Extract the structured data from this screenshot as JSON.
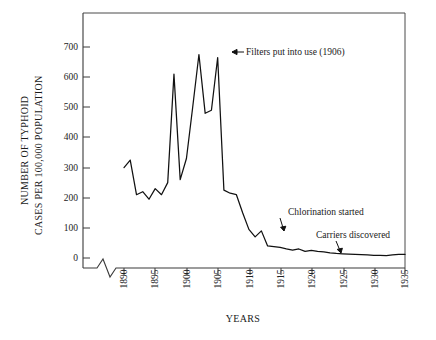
{
  "chart_data": {
    "type": "line",
    "title": "",
    "xlabel": "YEARS",
    "ylabel": "NUMBER OF TYPHOID CASES PER 100,000 POPULATION",
    "ylabel_line1": "NUMBER OF TYPHOID",
    "ylabel_line2": "CASES PER 100,000 POPULATION",
    "xlim": [
      1889,
      1935
    ],
    "ylim": [
      0,
      730
    ],
    "grid": false,
    "legend": "none",
    "axis_break": true,
    "yticks": [
      0,
      100,
      200,
      300,
      400,
      500,
      600,
      700
    ],
    "ytick_labels": [
      "0",
      "100",
      "200",
      "300",
      "400",
      "500",
      "600",
      "700"
    ],
    "xticks": [
      1890,
      1895,
      1900,
      1905,
      1910,
      1915,
      1920,
      1925,
      1930,
      1935
    ],
    "xtick_labels": [
      "1890",
      "1895",
      "1900",
      "1905",
      "1910",
      "1915",
      "1920",
      "1925",
      "1930",
      "1935"
    ],
    "series": [
      {
        "name": "Typhoid cases per 100,000 population",
        "color": "#111111",
        "x": [
          1890,
          1891,
          1892,
          1893,
          1894,
          1895,
          1896,
          1897,
          1898,
          1899,
          1900,
          1901,
          1902,
          1903,
          1904,
          1905,
          1906,
          1907,
          1908,
          1909,
          1910,
          1911,
          1912,
          1913,
          1914,
          1915,
          1916,
          1917,
          1918,
          1919,
          1920,
          1921,
          1922,
          1923,
          1924,
          1925,
          1926,
          1927,
          1928,
          1929,
          1930,
          1931,
          1932,
          1933,
          1934,
          1935
        ],
        "values": [
          300,
          325,
          210,
          220,
          195,
          230,
          210,
          250,
          610,
          260,
          330,
          500,
          675,
          480,
          490,
          665,
          225,
          215,
          210,
          150,
          95,
          70,
          90,
          40,
          38,
          35,
          30,
          26,
          30,
          22,
          25,
          22,
          20,
          17,
          15,
          14,
          13,
          12,
          11,
          10,
          9,
          9,
          8,
          10,
          12,
          12
        ]
      }
    ],
    "annotations": [
      {
        "id": "filters-annotation",
        "text": "Filters put into use (1906)",
        "arrow": "left",
        "target_year": 1906,
        "target_value": 665
      },
      {
        "id": "chlorination-annotation",
        "text": "Chlorination started",
        "arrow": "down",
        "target_year": 1913,
        "target_value": 90
      },
      {
        "id": "carriers-annotation",
        "text": "Carriers discovered",
        "arrow": "down",
        "target_year": 1923,
        "target_value": 17
      }
    ]
  },
  "colors": {
    "line": "#111111",
    "axis": "#3a3a3a",
    "text": "#1a1a1a",
    "background": "#ffffff"
  }
}
